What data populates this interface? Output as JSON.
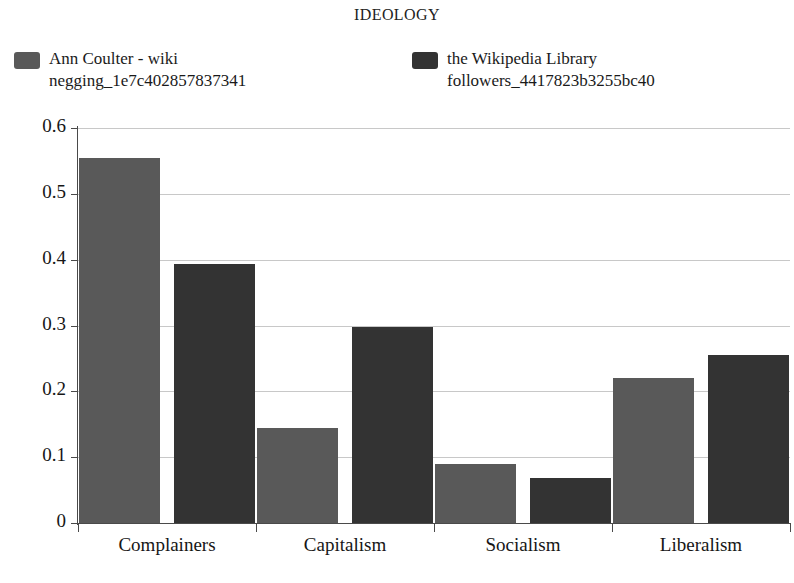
{
  "chart_data": {
    "type": "bar",
    "title": "IDEOLOGY",
    "xlabel": "",
    "ylabel": "",
    "categories": [
      "Complainers",
      "Capitalism",
      "Socialism",
      "Liberalism"
    ],
    "series": [
      {
        "name": "Ann Coulter - wiki negging_1e7c402857837341",
        "name_line1": "Ann Coulter - wiki",
        "name_line2": "negging_1e7c402857837341",
        "color": "#595959",
        "values": [
          0.555,
          0.144,
          0.09,
          0.221
        ]
      },
      {
        "name": "the Wikipedia Library followers_4417823b3255bc40",
        "name_line1": "the Wikipedia Library",
        "name_line2": "followers_4417823b3255bc40",
        "color": "#333333",
        "values": [
          0.394,
          0.297,
          0.069,
          0.255
        ]
      }
    ],
    "ylim": [
      0,
      0.6
    ],
    "yticks": [
      0,
      0.1,
      0.2,
      0.3,
      0.4,
      0.5,
      0.6
    ],
    "ytick_labels": [
      "0",
      "0.1",
      "0.2",
      "0.3",
      "0.4",
      "0.5",
      "0.6"
    ],
    "grid": true,
    "grid_color": "#c8c8c8",
    "legend_position": "top",
    "axis_color": "#4a4a4a",
    "background": "#ffffff"
  }
}
